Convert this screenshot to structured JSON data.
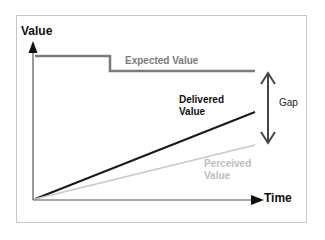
{
  "diagram": {
    "axes": {
      "y_label": "Value",
      "x_label": "Time"
    },
    "lines": {
      "expected": {
        "label": "Expected Value",
        "color": "#7a7a7a"
      },
      "delivered": {
        "label_line1": "Delivered",
        "label_line2": "Value",
        "color": "#1a1a1a"
      },
      "perceived": {
        "label_line1": "Perceived",
        "label_line2": "Value",
        "color": "#c4c4c4"
      }
    },
    "gap": {
      "label": "Gap",
      "color": "#444444"
    }
  }
}
